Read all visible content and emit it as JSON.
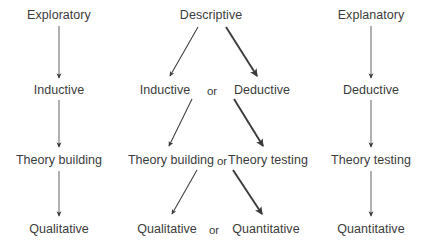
{
  "diagram": {
    "type": "flow-diagram",
    "text_color": "#3b3b3b",
    "arrow_color": "#3b3b3b",
    "background_color": "#ffffff",
    "connector_labels": {
      "or": "or"
    },
    "columns": [
      {
        "id": "exploratory",
        "name": "exploratory-column",
        "x": 59,
        "nodes": [
          {
            "id": "exploratory-purpose",
            "label": "Exploratory",
            "x": 59,
            "y": 8
          },
          {
            "id": "exploratory-reasoning",
            "label": "Inductive",
            "x": 59,
            "y": 83
          },
          {
            "id": "exploratory-theory",
            "label": "Theory building",
            "x": 59,
            "y": 153
          },
          {
            "id": "exploratory-data",
            "label": "Qualitative",
            "x": 59,
            "y": 222
          }
        ]
      },
      {
        "id": "descriptive",
        "name": "descriptive-column",
        "x": 211,
        "nodes": [
          {
            "id": "descriptive-purpose",
            "label": "Descriptive",
            "x": 211,
            "y": 8
          },
          {
            "id": "descriptive-reasoning-left",
            "label": "Inductive",
            "x": 165,
            "y": 83
          },
          {
            "id": "descriptive-reasoning-right",
            "label": "Deductive",
            "x": 262,
            "y": 83
          },
          {
            "id": "descriptive-theory-left",
            "label": "Theory building",
            "x": 171,
            "y": 153
          },
          {
            "id": "descriptive-theory-right",
            "label": "Theory testing",
            "x": 268,
            "y": 153
          },
          {
            "id": "descriptive-data-left",
            "label": "Qualitative",
            "x": 167,
            "y": 222
          },
          {
            "id": "descriptive-data-right",
            "label": "Quantitative",
            "x": 266,
            "y": 222
          }
        ],
        "or_labels": [
          {
            "id": "or-reasoning",
            "label": "or",
            "x": 212,
            "y": 84
          },
          {
            "id": "or-theory",
            "label": "or",
            "x": 222,
            "y": 154
          },
          {
            "id": "or-data",
            "label": "or",
            "x": 214,
            "y": 223
          }
        ]
      },
      {
        "id": "explanatory",
        "name": "explanatory-column",
        "x": 371,
        "nodes": [
          {
            "id": "explanatory-purpose",
            "label": "Explanatory",
            "x": 371,
            "y": 8
          },
          {
            "id": "explanatory-reasoning",
            "label": "Deductive",
            "x": 371,
            "y": 83
          },
          {
            "id": "explanatory-theory",
            "label": "Theory testing",
            "x": 371,
            "y": 153
          },
          {
            "id": "explanatory-data",
            "label": "Quantitative",
            "x": 371,
            "y": 222
          }
        ]
      }
    ]
  }
}
